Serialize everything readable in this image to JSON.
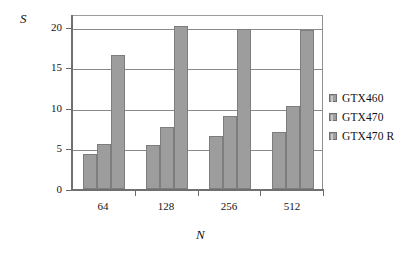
{
  "chart_data": {
    "type": "bar",
    "title": "",
    "xlabel": "N",
    "ylabel": "S",
    "categories": [
      "64",
      "128",
      "256",
      "512"
    ],
    "series": [
      {
        "name": "GTX460",
        "values": [
          4.3,
          5.4,
          6.5,
          7.0
        ]
      },
      {
        "name": "GTX470",
        "values": [
          5.6,
          7.6,
          9.0,
          10.2
        ]
      },
      {
        "name": "GTX470 R",
        "values": [
          16.5,
          20.1,
          19.8,
          19.6
        ]
      }
    ],
    "ylim": [
      0,
      21.6
    ],
    "ytick_labels": [
      "0",
      "5",
      "10",
      "15",
      "20"
    ],
    "ytick_values": [
      0,
      5,
      10,
      15,
      20
    ],
    "grid": true,
    "legend_position": "right",
    "bar_color": "#9d9d9d",
    "bar_edge_color": "#7d7d7d",
    "grid_color": "#8a8a8a",
    "axis_color": "#707070"
  },
  "legend": {
    "items": [
      {
        "label": "GTX460"
      },
      {
        "label": "GTX470"
      },
      {
        "label": "GTX470 R"
      }
    ]
  },
  "axes": {
    "y_title": "S",
    "x_title": "N"
  }
}
